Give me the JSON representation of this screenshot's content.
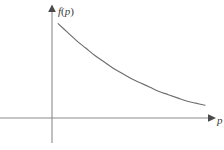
{
  "chart_data": {
    "type": "line",
    "title": "",
    "subtitle": "",
    "xlabel": "p",
    "ylabel": "f(p)",
    "ylabel_parts": {
      "function_name": "f",
      "open_paren": "(",
      "variable": "p",
      "close_paren": ")"
    },
    "grid": false,
    "legend": null,
    "annotations": [],
    "xlim": [
      0,
      10
    ],
    "ylim": [
      0,
      10
    ],
    "xticks": [],
    "yticks": [],
    "x_axis_arrow": true,
    "y_axis_arrow": true,
    "series": [
      {
        "name": "f(p)",
        "description": "decreasing convex curve approaching the horizontal axis asymptotically",
        "x": [
          0.4,
          1.0,
          1.6,
          2.2,
          2.8,
          3.4,
          4.0,
          4.6,
          5.2,
          5.8,
          6.4,
          7.0,
          7.6,
          8.2,
          8.8,
          9.4,
          10.0
        ],
        "y": [
          8.9,
          8.1,
          7.3,
          6.6,
          5.9,
          5.3,
          4.7,
          4.2,
          3.7,
          3.3,
          2.9,
          2.5,
          2.2,
          1.9,
          1.6,
          1.4,
          1.2
        ]
      }
    ]
  },
  "colors": {
    "background": "#ffffff",
    "axis": "#8c8c8c",
    "curve": "#6e6e6e",
    "label_text": "#3a3a3a"
  }
}
